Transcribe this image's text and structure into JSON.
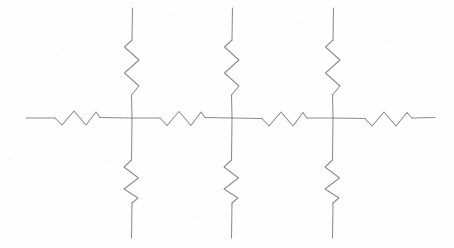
{
  "figure": {
    "kind": "hand-drawn-circuit-schematic",
    "background_color": "#fefefe",
    "ink_color": "#8c8c92",
    "stroke_width": 1.05,
    "width": 454,
    "height": 248,
    "labels": [],
    "annotations": []
  },
  "geometry": {
    "rail_y": 118,
    "rail_x_start": 26,
    "rail_x_end": 435,
    "node_x": [
      132,
      232,
      333
    ],
    "vertical_top_y": 8,
    "vertical_bottom_y": 238,
    "zigzag_amplitude_horizontal": 7,
    "zigzag_amplitude_vertical": 7,
    "zigzag_peaks": 3
  },
  "nodes": [
    {
      "name": "node-1",
      "x": 132,
      "y": 118
    },
    {
      "name": "node-2",
      "x": 232,
      "y": 118
    },
    {
      "name": "node-3",
      "x": 333,
      "y": 118
    }
  ],
  "wires": [
    {
      "name": "rail-lead-left",
      "path": "M 26 118 L 55 118"
    },
    {
      "name": "rail-between-r1-node1",
      "path": "M 100 117.5 L 132 118"
    },
    {
      "name": "rail-between-node1-r2",
      "path": "M 132 118 L 160 118"
    },
    {
      "name": "rail-between-r2-node2",
      "path": "M 205 117.5 L 232 118"
    },
    {
      "name": "rail-between-node2-r3",
      "path": "M 232 118 L 262 118.5"
    },
    {
      "name": "rail-between-r3-node3",
      "path": "M 307 118 L 333 118"
    },
    {
      "name": "rail-between-node3-r4",
      "path": "M 333 118 L 365 118.5"
    },
    {
      "name": "rail-lead-right",
      "path": "M 412 118 L 435 117.5"
    },
    {
      "name": "branch-1-top-lead-upper",
      "path": "M 132.5 8 L 132 40"
    },
    {
      "name": "branch-1-top-lead-lower",
      "path": "M 131.5 95 L 132 118"
    },
    {
      "name": "branch-1-bottom-lead-upper",
      "path": "M 132 118 L 131.5 160"
    },
    {
      "name": "branch-1-bottom-lead-lower",
      "path": "M 132 203 L 131.5 238"
    },
    {
      "name": "branch-2-top-lead-upper",
      "path": "M 232.5 8 L 232 40"
    },
    {
      "name": "branch-2-top-lead-lower",
      "path": "M 231.5 95 L 232 118"
    },
    {
      "name": "branch-2-bottom-lead-upper",
      "path": "M 232 118 L 231.5 160"
    },
    {
      "name": "branch-2-bottom-lead-lower",
      "path": "M 232 203 L 231.5 238"
    },
    {
      "name": "branch-3-top-lead-upper",
      "path": "M 333.5 8 L 333 40"
    },
    {
      "name": "branch-3-top-lead-lower",
      "path": "M 332.5 95 L 333 118"
    },
    {
      "name": "branch-3-bottom-lead-upper",
      "path": "M 333 118 L 332.5 160"
    },
    {
      "name": "branch-3-bottom-lead-lower",
      "path": "M 333 203 L 332.5 238"
    }
  ],
  "resistors": [
    {
      "name": "resistor-series-1",
      "orientation": "horizontal",
      "position": "rail-left-of-node-1",
      "path": "M 55 118 L 62 125 L 74 111 L 86 125 L 96 112 L 100 117.5"
    },
    {
      "name": "resistor-series-2",
      "orientation": "horizontal",
      "position": "rail-node1-to-node2",
      "path": "M 160 118 L 167 125.5 L 179 111.5 L 191 125.5 L 201 112 L 205 117.5"
    },
    {
      "name": "resistor-series-3",
      "orientation": "horizontal",
      "position": "rail-node2-to-node3",
      "path": "M 262 118.5 L 269 126 L 281 112 L 293 126 L 303 112.5 L 307 118"
    },
    {
      "name": "resistor-series-4",
      "orientation": "horizontal",
      "position": "rail-right-of-node-3",
      "path": "M 365 118.5 L 372 126 L 384 112 L 396 126 L 407 112.5 L 412 118"
    },
    {
      "name": "resistor-branch-1-top",
      "orientation": "vertical",
      "position": "above-node-1",
      "path": "M 132 40 L 124.5 47 L 139 60 L 124.5 73 L 139 86 L 131.5 95"
    },
    {
      "name": "resistor-branch-1-bottom",
      "orientation": "vertical",
      "position": "below-node-1",
      "path": "M 131.5 160 L 124 167 L 138.5 178 L 124 189 L 138 198 L 132 203"
    },
    {
      "name": "resistor-branch-2-top",
      "orientation": "vertical",
      "position": "above-node-2",
      "path": "M 232 40 L 224.5 47 L 239 60 L 224.5 73 L 239 86 L 231.5 95"
    },
    {
      "name": "resistor-branch-2-bottom",
      "orientation": "vertical",
      "position": "below-node-2",
      "path": "M 231.5 160 L 224 167 L 238.5 178 L 224 189 L 238 198 L 232 203"
    },
    {
      "name": "resistor-branch-3-top",
      "orientation": "vertical",
      "position": "above-node-3",
      "path": "M 333 40 L 325.5 47 L 340 60 L 325.5 73 L 340 86 L 332.5 95"
    },
    {
      "name": "resistor-branch-3-bottom",
      "orientation": "vertical",
      "position": "below-node-3",
      "path": "M 332.5 160 L 325 167 L 339.5 178 L 325 189 L 339 198 L 333 203"
    }
  ],
  "paper_specks": [
    {
      "x": 172,
      "y": 14
    },
    {
      "x": 160,
      "y": 44
    },
    {
      "x": 62,
      "y": 48
    },
    {
      "x": 196,
      "y": 58
    },
    {
      "x": 300,
      "y": 22
    },
    {
      "x": 388,
      "y": 40
    },
    {
      "x": 108,
      "y": 160
    },
    {
      "x": 8,
      "y": 158
    },
    {
      "x": 262,
      "y": 172
    },
    {
      "x": 356,
      "y": 196
    },
    {
      "x": 196,
      "y": 216
    },
    {
      "x": 420,
      "y": 148
    }
  ]
}
